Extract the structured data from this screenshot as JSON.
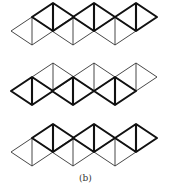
{
  "caption": "(b)",
  "figure": {
    "diamond_half_width": 21,
    "diamond_half_height": 14,
    "upper_centers_x": [
      53,
      94,
      136
    ],
    "lower_centers_x": [
      32,
      73,
      115
    ],
    "rows": [
      {
        "id": "row-1",
        "offset_y": 0,
        "bold_layer": "upper"
      },
      {
        "id": "row-2",
        "offset_y": 60,
        "bold_layer": "lower"
      },
      {
        "id": "row-3",
        "offset_y": 121,
        "bold_layer": "upper"
      }
    ],
    "colors": {
      "thin_stroke": "#333333",
      "bold_stroke": "#111111",
      "background": "#ffffff"
    }
  }
}
